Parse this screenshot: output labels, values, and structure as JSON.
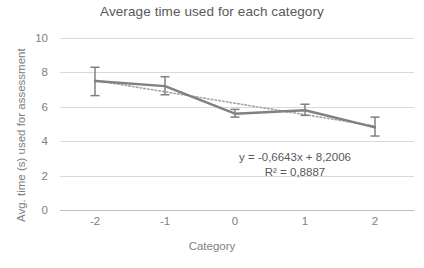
{
  "chart_data": {
    "type": "line",
    "title": "Average time used for each category",
    "xlabel": "Category",
    "ylabel": "Avg. time (s) used for assessment",
    "categories": [
      "-2",
      "-1",
      "0",
      "1",
      "2"
    ],
    "values": [
      7.5,
      7.2,
      5.6,
      5.8,
      4.8
    ],
    "error_upper": [
      0.8,
      0.55,
      0.25,
      0.35,
      0.6
    ],
    "error_lower": [
      0.85,
      0.5,
      0.2,
      0.3,
      0.5
    ],
    "series": [
      {
        "name": "Average time",
        "style": "solid",
        "color": "#808080",
        "values": [
          7.5,
          7.2,
          5.6,
          5.8,
          4.8
        ]
      },
      {
        "name": "Linear trendline",
        "style": "dotted",
        "color": "#a6a6a6",
        "values": [
          7.536,
          6.872,
          6.208,
          5.543,
          4.879
        ]
      }
    ],
    "ylim": [
      0,
      10
    ],
    "yticks": [
      "0",
      "2",
      "4",
      "6",
      "8",
      "10"
    ],
    "grid": true,
    "legend": "none",
    "annotations": {
      "equation": "y = -0,6643x + 8,2006",
      "r_squared": "R² = 0,8887"
    }
  },
  "colors": {
    "series_line": "#808080",
    "trendline": "#a6a6a6",
    "gridline": "#d9d9d9",
    "text": "#595959",
    "tick_text": "#808080",
    "background": "#ffffff"
  }
}
